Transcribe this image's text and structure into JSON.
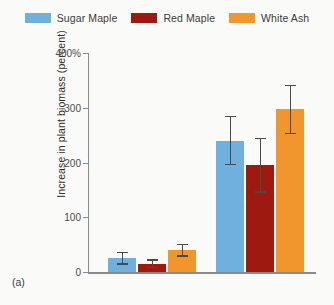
{
  "panel": {
    "label": "(a)"
  },
  "legend": {
    "position": "top-center",
    "items": [
      {
        "name": "Sugar Maple",
        "color": "#6FB0DE"
      },
      {
        "name": "Red Maple",
        "color": "#9E1A10"
      },
      {
        "name": "White Ash",
        "color": "#F0962D"
      }
    ]
  },
  "axis": {
    "ylabel": "Increase in plant biomass (percent)",
    "yticks": [
      "0",
      "100",
      "200",
      "300",
      "400%"
    ]
  },
  "chart_data": {
    "type": "bar",
    "title": "",
    "xlabel": "",
    "ylabel": "Increase in plant biomass (percent)",
    "ylim": [
      0,
      400
    ],
    "yticks": [
      0,
      100,
      200,
      300,
      400
    ],
    "ytick_labels": [
      "0",
      "100",
      "200",
      "300",
      "400%"
    ],
    "grid": false,
    "legend_position": "top-center",
    "categories": [
      "Group 1",
      "Group 2"
    ],
    "series": [
      {
        "name": "Sugar Maple",
        "color": "#6FB0DE",
        "values": [
          25,
          240
        ],
        "errors": [
          12,
          45
        ]
      },
      {
        "name": "Red Maple",
        "color": "#9E1A10",
        "values": [
          15,
          195
        ],
        "errors": [
          8,
          50
        ]
      },
      {
        "name": "White Ash",
        "color": "#F0962D",
        "values": [
          40,
          297
        ],
        "errors": [
          12,
          45
        ]
      }
    ],
    "error_bar_style": "symmetric-capped",
    "annotations": [
      "(a)"
    ]
  },
  "layout": {
    "plot_left": 88,
    "plot_top": 50,
    "plot_width": 228,
    "plot_height": 222,
    "group_x": [
      20,
      128
    ],
    "bar_width": 28,
    "bar_gap": 2
  }
}
